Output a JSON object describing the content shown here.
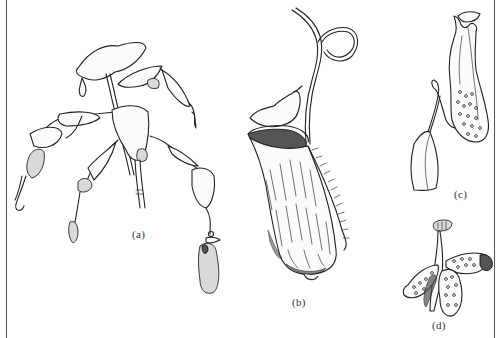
{
  "figure": {
    "panels": [
      {
        "id": "a",
        "label": "(a)",
        "description": "climbing stem with leaves, tendrils and pitchers"
      },
      {
        "id": "b",
        "label": "(b)",
        "description": "large pitcher with lid and coiled tendril"
      },
      {
        "id": "c",
        "label": "(c)",
        "description": "leaf with tendril bearing a dotted pitcher"
      },
      {
        "id": "d",
        "label": "(d)",
        "description": "cluster of small spotted pitchers"
      }
    ]
  }
}
